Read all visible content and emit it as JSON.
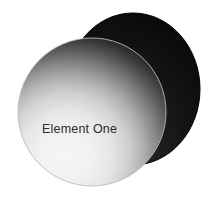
{
  "canvas": {
    "width": 217,
    "height": 207,
    "background_color": "#ffffff",
    "alt": "Two overlapping shaded circles, front one labeled Element One"
  },
  "diagram": {
    "type": "overlapping-shaded-circles",
    "shapes": [
      {
        "id": "back-circle",
        "name": "back-circle",
        "label": "",
        "cx": 133,
        "cy": 89,
        "rx": 66,
        "ry": 76,
        "fill_style": "solid-dark",
        "fill_color": "#141414",
        "edge_color": "#000000",
        "z": 1
      },
      {
        "id": "front-circle",
        "name": "front-circle",
        "label": "Element One",
        "cx": 92,
        "cy": 112,
        "rx": 74,
        "ry": 74,
        "fill_style": "radial-gradient",
        "gradient_highlight_color": "#ffffff",
        "gradient_shadow_color": "#000000",
        "gradient_focus_x": 0.34,
        "gradient_focus_y": 0.78,
        "edge_color": "#b8b8b8",
        "z": 2
      }
    ],
    "label": {
      "text": "Element One",
      "x": 42,
      "y": 133,
      "color": "#2b2b2b",
      "font_size_px": 12.5
    }
  },
  "colors": {
    "background": "#ffffff",
    "dark": "#000000",
    "light": "#ffffff",
    "back_shape": "#141414",
    "label_text": "#2b2b2b",
    "front_outline": "#b8b8b8"
  }
}
